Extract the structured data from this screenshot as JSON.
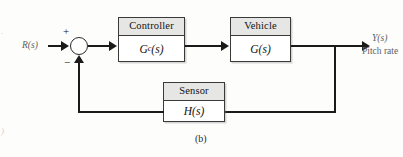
{
  "figure": {
    "caption": "(b)",
    "background": "#fdfdfc",
    "line_color": "#1a1a1a",
    "header_fill": "#e6e6e4"
  },
  "signals": {
    "input_label": "R(s)",
    "output_label": "Y(s)",
    "output_sublabel": "Pitch rate"
  },
  "summing_junction": {
    "positive_sign": "+",
    "negative_sign": "−"
  },
  "blocks": [
    {
      "id": "controller",
      "title": "Controller",
      "tf_main": "G",
      "tf_sub": "c",
      "tf_arg": "(s)"
    },
    {
      "id": "vehicle",
      "title": "Vehicle",
      "tf_main": "G",
      "tf_sub": "",
      "tf_arg": "(s)"
    },
    {
      "id": "sensor",
      "title": "Sensor",
      "tf_main": "H",
      "tf_sub": "",
      "tf_arg": "(s)"
    }
  ],
  "edge_artifacts": {
    "top_left": "·",
    "bottom_left": ")"
  }
}
